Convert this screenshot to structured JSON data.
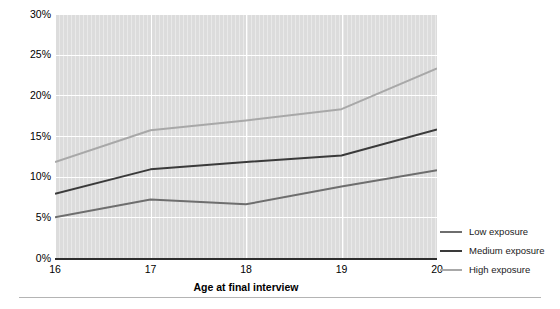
{
  "chart_data": {
    "type": "line",
    "title": "",
    "subtitle": "",
    "xlabel": "Age at final interview",
    "ylabel": "",
    "categories": [
      "16",
      "17",
      "18",
      "19",
      "20"
    ],
    "x": [
      16,
      17,
      18,
      19,
      20
    ],
    "xlim": [
      16,
      20
    ],
    "ylim": [
      0,
      30
    ],
    "y_tick_labels": [
      "30%",
      "25%",
      "20%",
      "15%",
      "10%",
      "5%",
      "0%"
    ],
    "y_tick_values": [
      30,
      25,
      20,
      15,
      10,
      5,
      0
    ],
    "x_tick_labels": [
      "16",
      "17",
      "18",
      "19",
      "20"
    ],
    "grid": "horizontal-and-vertical-white-gridlines",
    "plot_background": "#dcdcdc",
    "legend_position": "right",
    "value_units": "percent",
    "series": [
      {
        "name": "Low exposure",
        "color": "#6e6e6e",
        "values": [
          5.0,
          7.2,
          6.6,
          8.8,
          10.8
        ]
      },
      {
        "name": "Medium exposure",
        "color": "#3a3a3a",
        "values": [
          7.9,
          10.9,
          11.8,
          12.6,
          15.8
        ]
      },
      {
        "name": "High exposure",
        "color": "#a8a8a8",
        "values": [
          11.8,
          15.7,
          16.9,
          18.3,
          23.3
        ]
      }
    ]
  },
  "legend": {
    "items": [
      {
        "label": "Low exposure",
        "color": "#6e6e6e"
      },
      {
        "label": "Medium exposure",
        "color": "#3a3a3a"
      },
      {
        "label": "High exposure",
        "color": "#a8a8a8"
      }
    ]
  },
  "axis": {
    "x_title": "Age at final interview"
  }
}
